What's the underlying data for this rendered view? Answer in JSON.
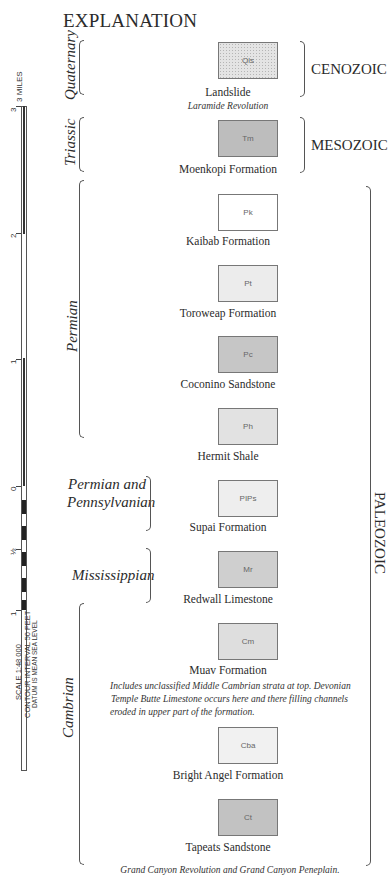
{
  "title": "EXPLANATION",
  "scale": {
    "units_label": "3 MILES",
    "ticks": [
      "3",
      "2",
      "1",
      "0",
      "½",
      "1"
    ],
    "lines": [
      "SCALE 1:48 000",
      "CONTOUR INTERVAL 50 FEET",
      "DATUM IS MEAN SEA LEVEL"
    ]
  },
  "eras": [
    {
      "name": "CENOZOIC"
    },
    {
      "name": "MESOZOIC"
    },
    {
      "name": "PALEOZOIC"
    }
  ],
  "periods": [
    {
      "name": "Quaternary"
    },
    {
      "name": "Triassic"
    },
    {
      "name": "Permian"
    },
    {
      "name": "Permian and"
    },
    {
      "name": "Pennsylvanian"
    },
    {
      "name": "Mississippian"
    },
    {
      "name": "Cambrian"
    }
  ],
  "units": [
    {
      "symbol": "Qls",
      "name": "Landslide",
      "fill": "#e6e6e6"
    },
    {
      "symbol": "Tm",
      "name": "Moenkopi Formation",
      "fill": "#bdbdbd"
    },
    {
      "symbol": "Pk",
      "name": "Kaibab Formation",
      "fill": "#ffffff"
    },
    {
      "symbol": "Pt",
      "name": "Toroweap Formation",
      "fill": "#ececec"
    },
    {
      "symbol": "Pc",
      "name": "Coconino Sandstone",
      "fill": "#c6c6c6"
    },
    {
      "symbol": "Ph",
      "name": "Hermit Shale",
      "fill": "#e2e2e2"
    },
    {
      "symbol": "PIPs",
      "name": "Supai Formation",
      "fill": "#eeeeee"
    },
    {
      "symbol": "Mr",
      "name": "Redwall Limestone",
      "fill": "#cfcfcf"
    },
    {
      "symbol": "Cm",
      "name": "Muav Formation",
      "fill": "#dedede"
    },
    {
      "symbol": "Cba",
      "name": "Bright Angel Formation",
      "fill": "#f1f1f1"
    },
    {
      "symbol": "Ct",
      "name": "Tapeats Sandstone",
      "fill": "#c2c2c2"
    }
  ],
  "notes": {
    "laramide": "Laramide Revolution",
    "muav_1": "Includes unclassified Middle Cambrian strata at top. Devonian",
    "muav_2": "Temple Butte Limestone occurs here and there filling channels",
    "muav_3": "eroded in upper part of the formation.",
    "grand_canyon": "Grand Canyon Revolution and Grand Canyon Peneplain."
  }
}
